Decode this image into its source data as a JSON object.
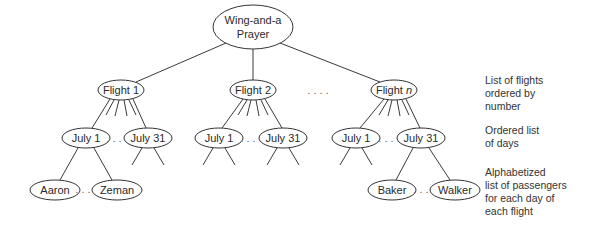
{
  "diagram": {
    "type": "tree",
    "root": {
      "label_line1": "Wing-and-a",
      "label_line2": "Prayer"
    },
    "flights": [
      {
        "label": "Flight 1"
      },
      {
        "label": "Flight 2"
      },
      {
        "label_prefix": "Flight ",
        "label_var": "n"
      }
    ],
    "flight_ellipsis": ". . . .",
    "days": {
      "flight1": [
        "July 1",
        "July 31"
      ],
      "flight2": [
        "July 1",
        "July 31"
      ],
      "flightn": [
        "July 1",
        "July 31"
      ],
      "ellipsis": ". . . ."
    },
    "passengers": {
      "flight1_july1": [
        "Aaron",
        "Zeman"
      ],
      "flightn_july31": [
        "Baker",
        "Walker"
      ],
      "ellipsis": ". . . ."
    },
    "side_labels": {
      "level1": "List of flights\nordered by\nnumber",
      "level2": "Ordered list\nof days",
      "level3": "Alphabetized\nlist of passengers\nfor each day of\neach flight"
    },
    "colors": {
      "stroke": "#333333",
      "background": "#ffffff",
      "text": "#2a2a2a"
    }
  }
}
